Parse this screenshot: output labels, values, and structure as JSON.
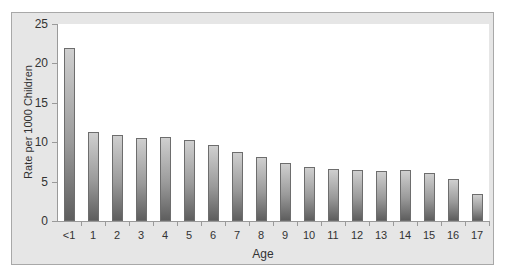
{
  "chart_data": {
    "type": "bar",
    "title": "",
    "xlabel": "Age",
    "ylabel": "Rate per 1000 Children",
    "ylim": [
      0,
      25
    ],
    "yticks": [
      0,
      5,
      10,
      15,
      20,
      25
    ],
    "grid": false,
    "legend": null,
    "categories": [
      "<1",
      "1",
      "2",
      "3",
      "4",
      "5",
      "6",
      "7",
      "8",
      "9",
      "10",
      "11",
      "12",
      "13",
      "14",
      "15",
      "16",
      "17"
    ],
    "values": [
      22.0,
      11.3,
      10.9,
      10.5,
      10.6,
      10.3,
      9.7,
      8.8,
      8.1,
      7.4,
      6.9,
      6.6,
      6.5,
      6.3,
      6.5,
      6.1,
      5.3,
      3.4
    ]
  },
  "colors": {
    "frame_background": "#e6e6e6",
    "plot_background": "#ffffff",
    "bar_top": "#cfcfcf",
    "bar_bottom": "#5e5e5e"
  }
}
